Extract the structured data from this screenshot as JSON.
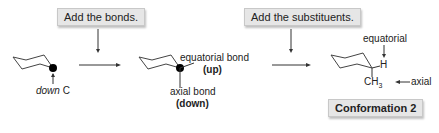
{
  "steps": [
    {
      "label": "Add the bonds."
    },
    {
      "label": "Add the substituents."
    }
  ],
  "structure1": {
    "label_italic": "down",
    "label_rest": " C"
  },
  "structure2": {
    "equatorial_label": "equatorial bond",
    "equatorial_dir": "(up)",
    "axial_label": "axial bond",
    "axial_dir": "(down)"
  },
  "structure3": {
    "equatorial_label": "equatorial",
    "h_label": "H",
    "ch3_label": "CH",
    "ch3_sub": "3",
    "axial_label": "axial"
  },
  "result_badge": {
    "label": "Conformation 2"
  },
  "colors": {
    "box_bg": "#e6e6e6",
    "line": "#333333",
    "dot": "#000000"
  }
}
